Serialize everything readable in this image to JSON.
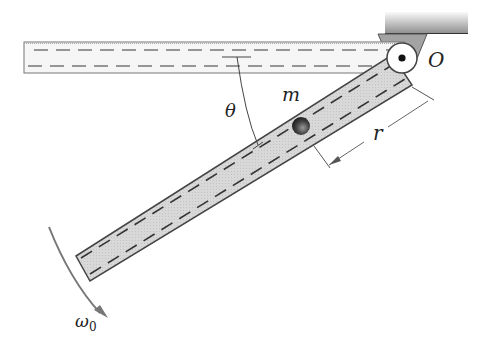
{
  "labels": {
    "pivot": "O",
    "mass": "m",
    "angle": "θ",
    "radius": "r",
    "angular_velocity": "ω",
    "angular_velocity_sub": "0"
  },
  "colors": {
    "tube_fill": "#d9d9d9",
    "tube_outline": "#444444",
    "dash": "#555555",
    "ceiling_top": "#f4f4f4",
    "ceiling_bottom": "#8a8a8a",
    "bracket": "#9a9a9a",
    "arrow": "#666666",
    "ball": "#333333"
  }
}
